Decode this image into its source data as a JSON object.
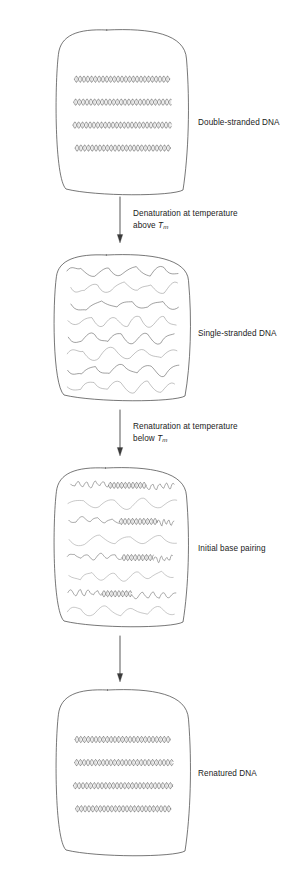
{
  "figure": {
    "background_color": "#ffffff",
    "line_color": "#3a3a3a",
    "text_color": "#1b1b1b"
  },
  "stages": [
    {
      "id": "double-stranded-dna",
      "label": "Double-stranded DNA",
      "content_type": "double-helix",
      "strand_count": 4,
      "box": {
        "x": 57,
        "y": 30,
        "w": 131,
        "h": 164
      },
      "label_pos": {
        "x": 198,
        "y": 117
      }
    },
    {
      "id": "single-stranded-dna",
      "label": "Single-stranded DNA",
      "content_type": "wavy-single-strands",
      "strand_count": 8,
      "box": {
        "x": 55,
        "y": 255,
        "w": 135,
        "h": 145
      },
      "label_pos": {
        "x": 198,
        "y": 328
      }
    },
    {
      "id": "initial-base-pairing",
      "label": "Initial base pairing",
      "content_type": "partial-pairing",
      "strand_count": 8,
      "box": {
        "x": 55,
        "y": 468,
        "w": 133,
        "h": 158
      },
      "label_pos": {
        "x": 198,
        "y": 543
      }
    },
    {
      "id": "renatured-dna",
      "label": "Renatured DNA",
      "content_type": "double-helix",
      "strand_count": 4,
      "box": {
        "x": 57,
        "y": 690,
        "w": 133,
        "h": 165
      },
      "label_pos": {
        "x": 198,
        "y": 768
      }
    }
  ],
  "arrows": [
    {
      "id": "denaturation-arrow",
      "line1": "Denaturation at temperature",
      "line2_prefix": "above ",
      "line2_symbol": "T",
      "line2_subscript": "m",
      "x": 120,
      "y_start": 197,
      "y_end": 243,
      "label_pos": {
        "x": 133,
        "y": 208
      }
    },
    {
      "id": "renaturation-arrow",
      "line1": "Renaturation at temperature",
      "line2_prefix": "below ",
      "line2_symbol": "T",
      "line2_subscript": "m",
      "x": 120,
      "y_start": 410,
      "y_end": 456,
      "label_pos": {
        "x": 133,
        "y": 421
      }
    },
    {
      "id": "final-arrow",
      "line1": "",
      "line2_prefix": "",
      "line2_symbol": "",
      "line2_subscript": "",
      "x": 120,
      "y_start": 636,
      "y_end": 682,
      "label_pos": {
        "x": 133,
        "y": 648
      }
    }
  ]
}
